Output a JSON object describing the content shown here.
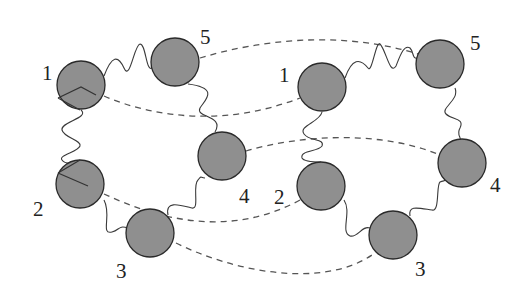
{
  "diagram": {
    "colors": {
      "bead_fill": "#8f8f8f",
      "bead_stroke": "#2a2a2a",
      "spring": "#3a3a3a",
      "dashed_link": "#555555"
    },
    "left_ring": {
      "beads": [
        {
          "label": "1",
          "cx": 81,
          "cy": 85
        },
        {
          "label": "2",
          "cx": 80,
          "cy": 184
        },
        {
          "label": "3",
          "cx": 150,
          "cy": 233
        },
        {
          "label": "4",
          "cx": 222,
          "cy": 156
        },
        {
          "label": "5",
          "cx": 175,
          "cy": 62
        }
      ]
    },
    "right_ring": {
      "beads": [
        {
          "label": "1",
          "cx": 322,
          "cy": 87
        },
        {
          "label": "2",
          "cx": 321,
          "cy": 186
        },
        {
          "label": "3",
          "cx": 393,
          "cy": 235
        },
        {
          "label": "4",
          "cx": 462,
          "cy": 163
        },
        {
          "label": "5",
          "cx": 440,
          "cy": 64
        }
      ]
    },
    "bead_radius": 24
  }
}
